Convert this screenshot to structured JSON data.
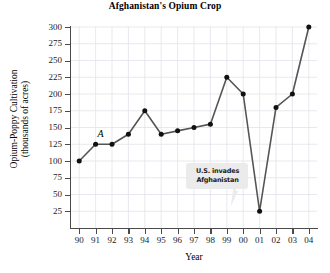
{
  "chart_data": {
    "type": "line",
    "title": "Afghanistan's Opium Crop",
    "xlabel": "Year",
    "ylabel": "Opium-Poppy Cultivation\n(thousands of acres)",
    "ylabel_line1": "Opium-Poppy Cultivation",
    "ylabel_line2": "(thousands of acres)",
    "categories": [
      "90",
      "91",
      "92",
      "93",
      "94",
      "95",
      "96",
      "97",
      "98",
      "99",
      "00",
      "01",
      "02",
      "03",
      "04"
    ],
    "values": [
      100,
      125,
      125,
      140,
      175,
      140,
      145,
      150,
      155,
      225,
      200,
      25,
      180,
      200,
      300
    ],
    "ylim": [
      0,
      300
    ],
    "yticks": [
      25,
      50,
      75,
      100,
      125,
      150,
      175,
      200,
      225,
      250,
      275,
      300
    ],
    "ytick_labels": [
      "25",
      "50",
      "75",
      "100",
      "125",
      "150",
      "175",
      "200",
      "225",
      "250",
      "275",
      "300"
    ],
    "grid": true,
    "legend": "none",
    "series_color": "#555555",
    "marker_color": "#111111",
    "grid_color": "#dfe3ea",
    "annotations": [
      {
        "name": "point-label-A",
        "text": "A",
        "at_category": "91",
        "at_value": 125,
        "style": "italic"
      },
      {
        "name": "callout-us-invades",
        "line1": "U.S. invades",
        "line2": "Afghanistan",
        "points_to_category": "01",
        "points_to_value": 25
      }
    ]
  }
}
